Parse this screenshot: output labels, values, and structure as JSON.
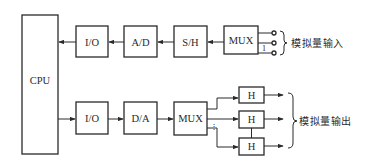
{
  "diagram": {
    "cpu": {
      "label": "CPU"
    },
    "input_chain": {
      "blocks": [
        {
          "id": "io_in",
          "label": "I/O"
        },
        {
          "id": "ad",
          "label": "A/D"
        },
        {
          "id": "sh",
          "label": "S/H"
        },
        {
          "id": "mux_in",
          "label": "MUX"
        }
      ],
      "channel_marker": "1",
      "terminal_count": 3,
      "group_label": "模拟量输入"
    },
    "output_chain": {
      "blocks": [
        {
          "id": "io_out",
          "label": "I/O"
        },
        {
          "id": "da",
          "label": "D/A"
        },
        {
          "id": "mux_out",
          "label": "MUX"
        }
      ],
      "hold_blocks": [
        {
          "id": "h1",
          "label": "H"
        },
        {
          "id": "h2",
          "label": "H"
        },
        {
          "id": "h3",
          "label": "H"
        }
      ],
      "channel_marker": "⋮",
      "group_label": "模拟量输出"
    },
    "colors": {
      "stroke": "#2a2a2a",
      "background": "#ffffff"
    }
  }
}
